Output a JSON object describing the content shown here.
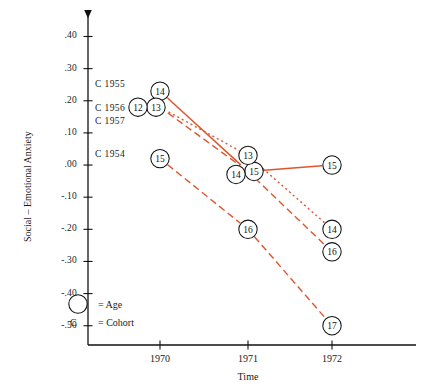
{
  "chart_data": {
    "type": "line",
    "title": "",
    "xlabel": "Time",
    "ylabel": "Social – Emotional Anxiety",
    "x": [
      1970,
      1971,
      1972
    ],
    "xtick_labels": [
      "1970",
      "1971",
      "1972"
    ],
    "ytick_labels": [
      ".40",
      ".30",
      ".20",
      ".10",
      ".00",
      "-.10",
      "-.20",
      "-.30",
      "-.40",
      "-.50"
    ],
    "ytick_values": [
      0.4,
      0.3,
      0.2,
      0.1,
      0.0,
      -0.1,
      -0.2,
      -0.3,
      -0.4,
      -0.5
    ],
    "ylim": [
      -0.56,
      0.47
    ],
    "grid": false,
    "legend_position": "bottom-left",
    "line_color": "#e0552c",
    "series": [
      {
        "name": "C 1954",
        "style": "solid",
        "points": [
          {
            "x": 1970,
            "y": 0.23,
            "age": "14"
          },
          {
            "x": 1971,
            "y": -0.02,
            "age": "15"
          },
          {
            "x": 1972,
            "y": 0.0,
            "age": "15"
          }
        ]
      },
      {
        "name": "C 1955",
        "style": "dashed",
        "points": [
          {
            "x": 1970,
            "y": 0.18,
            "age": "13"
          },
          {
            "x": 1971,
            "y": -0.02,
            "age": "14"
          },
          {
            "x": 1972,
            "y": -0.27,
            "age": "16"
          }
        ]
      },
      {
        "name": "C 1956",
        "style": "dotted",
        "points": [
          {
            "x": 1970,
            "y": 0.18,
            "age": "12"
          },
          {
            "x": 1971,
            "y": 0.03,
            "age": "13"
          },
          {
            "x": 1972,
            "y": -0.2,
            "age": "14"
          }
        ]
      },
      {
        "name": "C 1957",
        "style": "dashed",
        "points": [
          {
            "x": 1970,
            "y": 0.02,
            "age": "15"
          },
          {
            "x": 1971,
            "y": -0.2,
            "age": "16"
          },
          {
            "x": 1972,
            "y": -0.5,
            "age": "17"
          }
        ]
      }
    ],
    "cohort_labels": [
      {
        "text": "C 1955",
        "y": 0.25
      },
      {
        "text": "C 1956",
        "y": 0.175
      },
      {
        "text": "C 1957",
        "y": 0.135
      },
      {
        "text": "C 1954",
        "y": 0.03
      }
    ],
    "annotations": []
  },
  "legend": {
    "age_symbol": "○",
    "age_text": "= Age",
    "cohort_symbol": "C",
    "cohort_text": "= Cohort"
  }
}
